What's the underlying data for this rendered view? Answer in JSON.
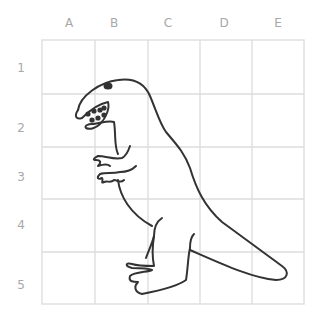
{
  "grid": {
    "columns": [
      "A",
      "B",
      "C",
      "D",
      "E"
    ],
    "rows": [
      "1",
      "2",
      "3",
      "4",
      "5"
    ],
    "line_color": "#dcdcdc",
    "label_color": "#a8a8a8"
  },
  "drawing": {
    "subject": "dinosaur-outline",
    "stroke_color": "#333333"
  }
}
